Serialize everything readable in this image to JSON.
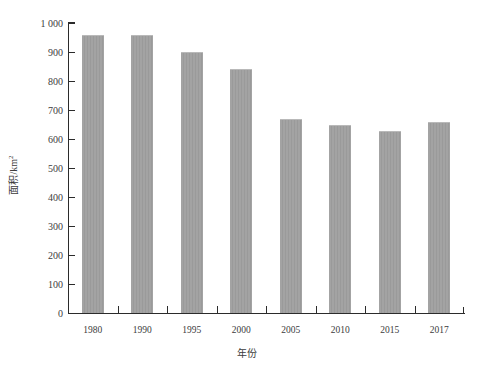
{
  "chart_data": {
    "type": "bar",
    "title": "",
    "subtitle": "",
    "xlabel": "年份",
    "ylabel": "面积/km²",
    "categories": [
      "1980",
      "1990",
      "1995",
      "2000",
      "2005",
      "2010",
      "2015",
      "2017"
    ],
    "values": [
      960,
      960,
      900,
      841,
      669,
      648,
      628,
      659
    ],
    "series": [
      {
        "name": "面积",
        "values": [
          960,
          960,
          900,
          841,
          669,
          648,
          628,
          659
        ]
      }
    ],
    "ylim": [
      0,
      1000
    ],
    "ytick_values": [
      0,
      100,
      200,
      300,
      400,
      500,
      600,
      700,
      800,
      900,
      1000
    ],
    "ytick_labels": [
      "0",
      "100",
      "200",
      "300",
      "400",
      "500",
      "600",
      "700",
      "800",
      "900",
      "1 000"
    ],
    "grid": false,
    "legend": false,
    "legend_position": "none",
    "bar_color": "#a3a3a3",
    "axis_color": "#2b2b2b",
    "text_color": "#3c3c3c",
    "background_color": "#ffffff"
  },
  "axis": {
    "y_title_text": "面积/km",
    "y_title_exponent": "2",
    "x_title_text": "年份"
  }
}
